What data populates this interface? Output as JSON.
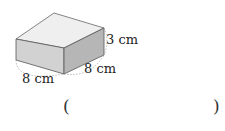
{
  "figure": {
    "shape": "rectangular-prism",
    "dimensions": {
      "height": "3 cm",
      "depth": "8 cm",
      "width": "8 cm"
    },
    "colors": {
      "top_face": "#efefef",
      "front_face": "#d2d2d2",
      "side_face": "#b6b6b6",
      "edge": "#555555",
      "dashed_arc": "#999999"
    }
  },
  "answer": {
    "open_paren": "(",
    "close_paren": ")",
    "value": ""
  }
}
